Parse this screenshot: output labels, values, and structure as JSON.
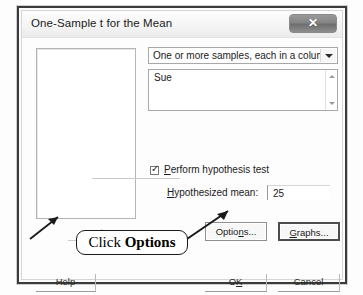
{
  "dialog": {
    "title": "One-Sample t for the Mean",
    "close_icon": "close-icon",
    "close_glyph": "✕"
  },
  "variable_list": {
    "items": [],
    "select_label": "Select"
  },
  "sample_source": {
    "dropdown_value": "One or more samples, each in a column",
    "dropdown_icon": "chevron-down-icon",
    "selected_columns": [
      "Sue"
    ],
    "scroll_up_icon": "caret-up-icon",
    "scroll_down_icon": "caret-down-icon"
  },
  "hypothesis": {
    "checkbox_label_prefix": "",
    "checkbox_accelerator": "P",
    "checkbox_label_rest": "erform hypothesis test",
    "checkbox_checked": true,
    "check_glyph": "✓",
    "mean_accelerator": "H",
    "mean_label_rest": "ypothesized mean:",
    "mean_value": "25"
  },
  "buttons": {
    "options_prefix": "Optio",
    "options_accelerator": "n",
    "options_suffix": "s...",
    "graphs_accelerator": "G",
    "graphs_rest": "raphs...",
    "help_label": "Help",
    "ok_prefix": "O",
    "ok_accelerator": "K",
    "cancel_label": "Cancel"
  },
  "annotation": {
    "callout_prefix": "Click ",
    "callout_emphasis": "Options"
  }
}
